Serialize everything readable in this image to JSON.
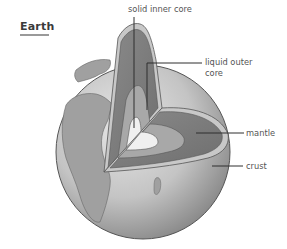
{
  "title": "Earth",
  "labels": {
    "inner_core": "solid inner core",
    "outer_core_line1": "liquid outer",
    "outer_core_line2": "core",
    "mantle": "mantle",
    "crust": "crust"
  },
  "colors": {
    "globe_light": "#e4e4e4",
    "globe_mid": "#bdbdbd",
    "globe_dark": "#7a7a7a",
    "continent": "#9c9c9c",
    "crust": "#c8c8c8",
    "mantle": "#7d7d7d",
    "outer_core": "#a8a8a8",
    "inner_core": "#f0f0f0",
    "leader_line": "#2e2e2e",
    "label_text": "#555555"
  }
}
